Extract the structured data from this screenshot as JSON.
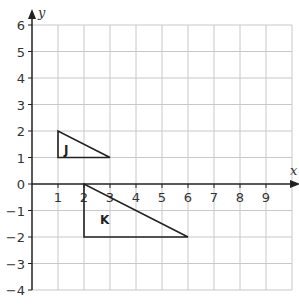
{
  "diagram": {
    "x_axis_label": "x",
    "y_axis_label": "y",
    "x_range": [
      0,
      10
    ],
    "y_range": [
      -4,
      6
    ],
    "x_ticks": [
      "1",
      "2",
      "3",
      "4",
      "5",
      "6",
      "7",
      "8",
      "9"
    ],
    "y_ticks": [
      "6",
      "5",
      "4",
      "3",
      "2",
      "1",
      "0",
      "−1",
      "−2",
      "−3",
      "−4"
    ],
    "origin_label": "0",
    "shapes": [
      {
        "label": "J",
        "vertices": [
          [
            1,
            1
          ],
          [
            1,
            2
          ],
          [
            3,
            1
          ]
        ]
      },
      {
        "label": "K",
        "vertices": [
          [
            2,
            0
          ],
          [
            2,
            -2
          ],
          [
            6,
            -2
          ]
        ]
      }
    ],
    "colors": {
      "grid": "#c8c8c8",
      "axis": "#222222",
      "shape": "#222222"
    }
  }
}
